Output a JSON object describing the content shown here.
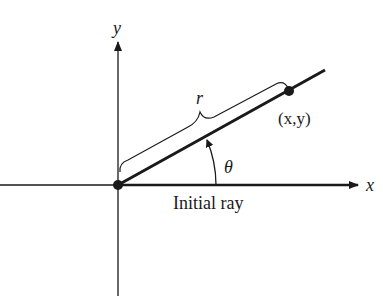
{
  "diagram": {
    "axes": {
      "x_label": "x",
      "y_label": "y"
    },
    "labels": {
      "radius": "r",
      "point": "(x,y)",
      "angle": "θ",
      "initial_ray": "Initial ray"
    },
    "colors": {
      "ink": "#1a1a1a",
      "background": "#ffffff"
    }
  }
}
